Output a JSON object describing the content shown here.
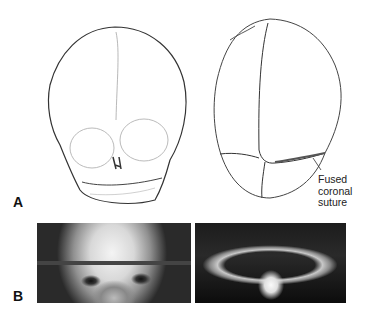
{
  "figure": {
    "panel_a": {
      "label": "A",
      "left_drawing": "skull-frontal-view",
      "right_drawing": "skull-top-view",
      "annotation": [
        "Fused",
        "coronal",
        "suture"
      ]
    },
    "panel_b": {
      "label": "B",
      "left_photo": "child-face-frontal-view",
      "right_photo": "child-head-vertex-view"
    }
  }
}
